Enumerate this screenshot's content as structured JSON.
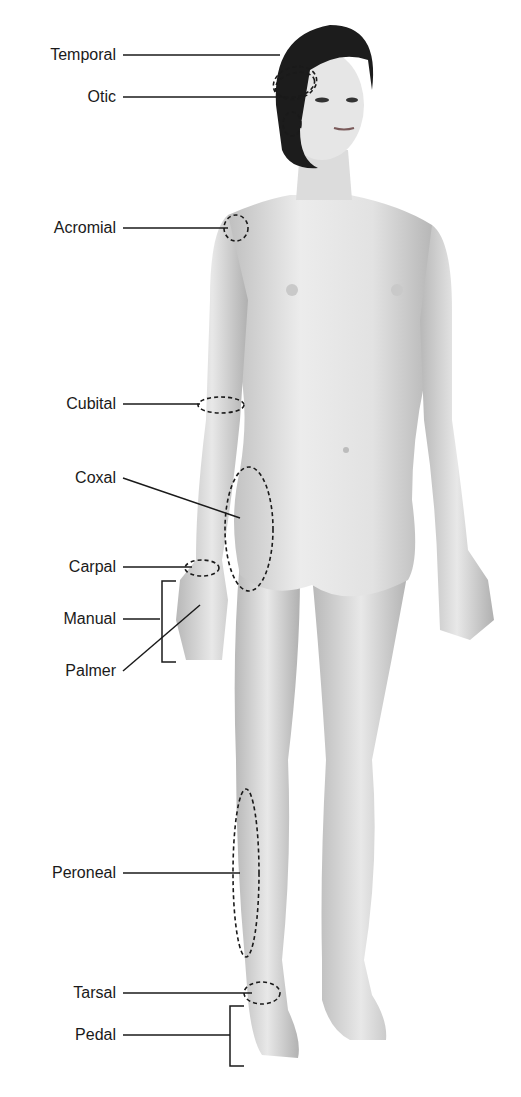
{
  "diagram": {
    "colors": {
      "skin_light": "#ececec",
      "skin_shade": "#bdbdbd",
      "hair": "#1c1c1c",
      "lines": "#1a1a1a"
    },
    "labels": [
      {
        "id": "temporal",
        "text": "Temporal",
        "y": 55
      },
      {
        "id": "otic",
        "text": "Otic",
        "y": 97
      },
      {
        "id": "acromial",
        "text": "Acromial",
        "y": 228
      },
      {
        "id": "cubital",
        "text": "Cubital",
        "y": 404
      },
      {
        "id": "coxal",
        "text": "Coxal",
        "y": 478
      },
      {
        "id": "carpal",
        "text": "Carpal",
        "y": 567
      },
      {
        "id": "manual",
        "text": "Manual",
        "y": 619
      },
      {
        "id": "palmer",
        "text": "Palmer",
        "y": 671
      },
      {
        "id": "peroneal",
        "text": "Peroneal",
        "y": 873
      },
      {
        "id": "tarsal",
        "text": "Tarsal",
        "y": 993
      },
      {
        "id": "pedal",
        "text": "Pedal",
        "y": 1035
      }
    ]
  }
}
